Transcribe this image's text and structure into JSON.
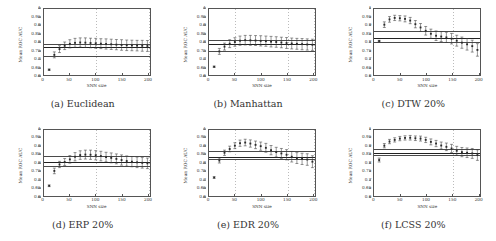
{
  "figure": {
    "axis": {
      "ylabel": "Mean ROC AUC",
      "xlabel": "SNN size",
      "yticks": [
        "1",
        "0.95",
        "0.9",
        "0.85",
        "0.8",
        "0.75",
        "0.7",
        "0.65",
        "0.6"
      ],
      "ytick_values": [
        1,
        0.95,
        0.9,
        0.85,
        0.8,
        0.75,
        0.7,
        0.65,
        0.6
      ],
      "xticks": [
        "0",
        "50",
        "100",
        "150",
        "200"
      ],
      "xtick_values": [
        0,
        50,
        100,
        150,
        200
      ],
      "ylim": [
        0.6,
        1.0
      ],
      "xlim": [
        0,
        205
      ]
    },
    "captions": [
      "(a) Euclidean",
      "(b) Manhattan",
      "(c) DTW 20%",
      "(d) ERP 20%",
      "(e) EDR 20%",
      "(f) LCSS 20%"
    ]
  },
  "chart_data": [
    {
      "type": "scatter",
      "title": "(a) Euclidean",
      "xlabel": "SNN size",
      "ylabel": "Mean ROC AUC",
      "xlim": [
        0,
        205
      ],
      "ylim": [
        0.6,
        1.0
      ],
      "grid": true,
      "reference_lines": [
        {
          "name": "baseline-upper",
          "value": 0.795
        },
        {
          "name": "baseline-mean",
          "value": 0.775
        },
        {
          "name": "baseline-lower",
          "value": 0.725
        }
      ],
      "x": [
        10,
        20,
        30,
        40,
        50,
        60,
        70,
        80,
        90,
        100,
        110,
        120,
        130,
        140,
        150,
        160,
        170,
        180,
        190,
        200
      ],
      "values": [
        0.632,
        0.722,
        0.757,
        0.777,
        0.789,
        0.795,
        0.797,
        0.796,
        0.794,
        0.792,
        0.79,
        0.788,
        0.786,
        0.784,
        0.782,
        0.78,
        0.779,
        0.778,
        0.777,
        0.776
      ],
      "yerr": [
        0.004,
        0.018,
        0.021,
        0.023,
        0.025,
        0.027,
        0.028,
        0.029,
        0.029,
        0.03,
        0.03,
        0.031,
        0.031,
        0.031,
        0.032,
        0.032,
        0.032,
        0.032,
        0.033,
        0.033
      ]
    },
    {
      "type": "scatter",
      "title": "(b) Manhattan",
      "xlabel": "SNN size",
      "ylabel": "Mean ROC AUC",
      "xlim": [
        0,
        205
      ],
      "ylim": [
        0.6,
        1.0
      ],
      "grid": true,
      "reference_lines": [
        {
          "name": "baseline-upper",
          "value": 0.818
        },
        {
          "name": "baseline-mean",
          "value": 0.793
        },
        {
          "name": "baseline-lower",
          "value": 0.752
        }
      ],
      "x": [
        10,
        20,
        30,
        40,
        50,
        60,
        70,
        80,
        90,
        100,
        110,
        120,
        130,
        140,
        150,
        160,
        170,
        180,
        190,
        200
      ],
      "values": [
        0.65,
        0.743,
        0.772,
        0.79,
        0.8,
        0.808,
        0.811,
        0.81,
        0.809,
        0.807,
        0.805,
        0.802,
        0.8,
        0.797,
        0.794,
        0.791,
        0.789,
        0.787,
        0.785,
        0.783
      ],
      "yerr": [
        0.004,
        0.018,
        0.021,
        0.024,
        0.026,
        0.028,
        0.029,
        0.03,
        0.03,
        0.031,
        0.031,
        0.032,
        0.032,
        0.032,
        0.033,
        0.033,
        0.033,
        0.034,
        0.034,
        0.034
      ]
    },
    {
      "type": "scatter",
      "title": "(c) DTW 20%",
      "xlabel": "SNN size",
      "ylabel": "Mean ROC AUC",
      "xlim": [
        0,
        205
      ],
      "ylim": [
        0.6,
        1.0
      ],
      "grid": true,
      "reference_lines": [
        {
          "name": "baseline-upper",
          "value": 0.868
        },
        {
          "name": "baseline-mean",
          "value": 0.828
        },
        {
          "name": "baseline-lower",
          "value": 0.805
        }
      ],
      "x": [
        10,
        20,
        30,
        40,
        50,
        60,
        70,
        80,
        90,
        100,
        110,
        120,
        130,
        140,
        150,
        160,
        170,
        180,
        190,
        200
      ],
      "values": [
        0.806,
        0.905,
        0.937,
        0.946,
        0.944,
        0.94,
        0.93,
        0.908,
        0.888,
        0.868,
        0.85,
        0.838,
        0.833,
        0.828,
        0.82,
        0.808,
        0.796,
        0.786,
        0.775,
        0.752
      ],
      "yerr": [
        0.004,
        0.017,
        0.017,
        0.016,
        0.016,
        0.018,
        0.019,
        0.022,
        0.024,
        0.026,
        0.028,
        0.029,
        0.03,
        0.031,
        0.032,
        0.033,
        0.034,
        0.035,
        0.036,
        0.038
      ]
    },
    {
      "type": "scatter",
      "title": "(d) ERP 20%",
      "xlabel": "SNN size",
      "ylabel": "Mean ROC AUC",
      "xlim": [
        0,
        205
      ],
      "ylim": [
        0.6,
        1.0
      ],
      "grid": true,
      "reference_lines": [
        {
          "name": "baseline-upper",
          "value": 0.843
        },
        {
          "name": "baseline-mean",
          "value": 0.806
        },
        {
          "name": "baseline-lower",
          "value": 0.783
        }
      ],
      "x": [
        10,
        20,
        30,
        40,
        50,
        60,
        70,
        80,
        90,
        100,
        110,
        120,
        130,
        140,
        150,
        160,
        170,
        180,
        190,
        200
      ],
      "values": [
        0.662,
        0.752,
        0.791,
        0.806,
        0.822,
        0.838,
        0.848,
        0.851,
        0.85,
        0.847,
        0.842,
        0.836,
        0.831,
        0.825,
        0.818,
        0.812,
        0.808,
        0.804,
        0.801,
        0.798
      ],
      "yerr": [
        0.005,
        0.017,
        0.019,
        0.021,
        0.023,
        0.025,
        0.026,
        0.027,
        0.028,
        0.028,
        0.029,
        0.029,
        0.03,
        0.03,
        0.031,
        0.031,
        0.031,
        0.032,
        0.032,
        0.032
      ]
    },
    {
      "type": "scatter",
      "title": "(e) EDR 20%",
      "xlabel": "SNN size",
      "ylabel": "Mean ROC AUC",
      "xlim": [
        0,
        205
      ],
      "ylim": [
        0.6,
        1.0
      ],
      "grid": true,
      "reference_lines": [
        {
          "name": "baseline-upper",
          "value": 0.871
        },
        {
          "name": "baseline-mean",
          "value": 0.838
        },
        {
          "name": "baseline-lower",
          "value": 0.828
        }
      ],
      "x": [
        10,
        20,
        30,
        40,
        50,
        60,
        70,
        80,
        90,
        100,
        110,
        120,
        130,
        140,
        150,
        160,
        170,
        180,
        190,
        200
      ],
      "values": [
        0.712,
        0.815,
        0.862,
        0.885,
        0.905,
        0.92,
        0.924,
        0.918,
        0.91,
        0.902,
        0.892,
        0.878,
        0.866,
        0.858,
        0.85,
        0.838,
        0.83,
        0.825,
        0.821,
        0.808
      ],
      "yerr": [
        0.005,
        0.015,
        0.016,
        0.017,
        0.018,
        0.019,
        0.02,
        0.022,
        0.023,
        0.025,
        0.027,
        0.028,
        0.029,
        0.03,
        0.031,
        0.032,
        0.033,
        0.034,
        0.035,
        0.036
      ]
    },
    {
      "type": "scatter",
      "title": "(f) LCSS 20%",
      "xlabel": "SNN size",
      "ylabel": "Mean ROC AUC",
      "xlim": [
        0,
        205
      ],
      "ylim": [
        0.6,
        1.0
      ],
      "grid": true,
      "reference_lines": [
        {
          "name": "baseline-upper",
          "value": 0.888
        },
        {
          "name": "baseline-mean",
          "value": 0.862
        },
        {
          "name": "baseline-lower",
          "value": 0.852
        }
      ],
      "x": [
        10,
        20,
        30,
        40,
        50,
        60,
        70,
        80,
        90,
        100,
        110,
        120,
        130,
        140,
        150,
        160,
        170,
        180,
        190,
        200
      ],
      "values": [
        0.818,
        0.905,
        0.93,
        0.94,
        0.948,
        0.952,
        0.953,
        0.95,
        0.948,
        0.94,
        0.928,
        0.918,
        0.906,
        0.898,
        0.888,
        0.874,
        0.866,
        0.862,
        0.858,
        0.848
      ],
      "yerr": [
        0.012,
        0.013,
        0.013,
        0.013,
        0.013,
        0.013,
        0.014,
        0.014,
        0.015,
        0.016,
        0.018,
        0.019,
        0.021,
        0.023,
        0.025,
        0.027,
        0.028,
        0.029,
        0.03,
        0.032
      ]
    }
  ]
}
